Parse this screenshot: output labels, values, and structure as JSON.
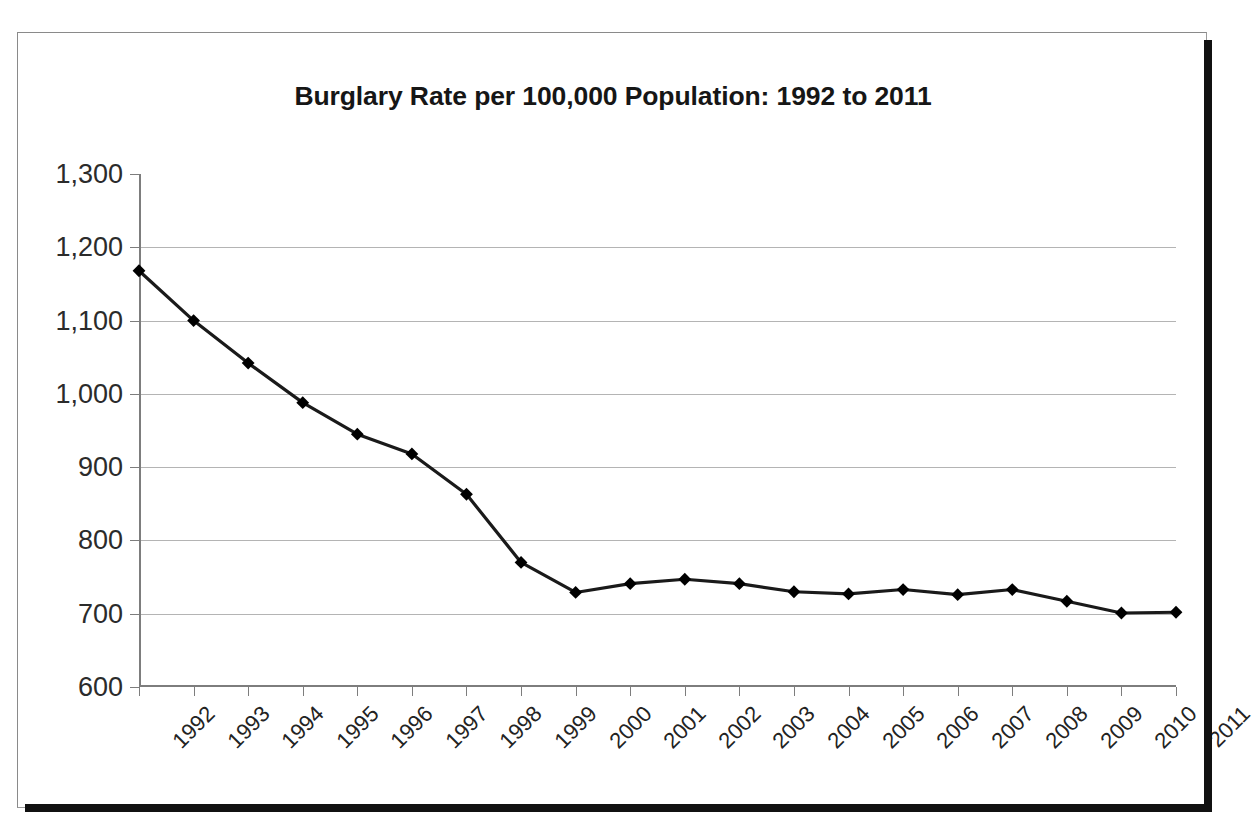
{
  "chart_data": {
    "type": "line",
    "title": "Burglary Rate per 100,000 Population: 1992 to 2011",
    "xlabel": "",
    "ylabel": "",
    "grid": true,
    "legend": false,
    "legend_position": "none",
    "xlim": [
      1992,
      2011
    ],
    "ylim": [
      600,
      1300
    ],
    "ytick_step": 100,
    "ytick_labels": [
      "1,300",
      "1,200",
      "1,100",
      "1,000",
      "900",
      "800",
      "700",
      "600"
    ],
    "ytick_values": [
      1300,
      1200,
      1100,
      1000,
      900,
      800,
      700,
      600
    ],
    "categories": [
      "1992",
      "1993",
      "1994",
      "1995",
      "1996",
      "1997",
      "1998",
      "1999",
      "2000",
      "2001",
      "2002",
      "2003",
      "2004",
      "2005",
      "2006",
      "2007",
      "2008",
      "2009",
      "2010",
      "2011"
    ],
    "values": [
      1168,
      1100,
      1042,
      988,
      945,
      918,
      863,
      770,
      729,
      741,
      747,
      741,
      730,
      727,
      733,
      726,
      733,
      717,
      701,
      702
    ],
    "series": [
      {
        "name": "Burglary rate per 100,000 population",
        "marker": "diamond",
        "color": "#000000",
        "values": [
          1168,
          1100,
          1042,
          988,
          945,
          918,
          863,
          770,
          729,
          741,
          747,
          741,
          730,
          727,
          733,
          726,
          733,
          717,
          701,
          702
        ]
      }
    ],
    "colors": {
      "line": "#1a1a1a",
      "marker": "#000000",
      "grid": "#b4b4b4",
      "axis": "#7d7d7d",
      "text": "#161616",
      "background": "#ffffff",
      "frame": "#111111"
    }
  }
}
